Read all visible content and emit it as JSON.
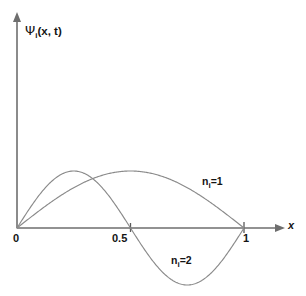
{
  "figure": {
    "background_color": "#ffffff",
    "axis_color": "#6e6e6e",
    "curve_color": "#8a8a8a",
    "text_color": "#141414"
  },
  "axes": {
    "y_label_symbol": "Ψ",
    "y_label_subscript": "i",
    "y_label_rest": "(x, t)",
    "y_label_full": "Ψi (x, t)",
    "x_label": "x",
    "x_ticks": [
      {
        "value": 0,
        "label": "0"
      },
      {
        "value": 0.5,
        "label": "0.5"
      },
      {
        "value": 1,
        "label": "1"
      }
    ]
  },
  "annotations": {
    "n1": {
      "symbol": "n",
      "subscript": "i",
      "equals": "=",
      "value": "1",
      "text": "n i = 1"
    },
    "n2": {
      "symbol": "n",
      "subscript": "i",
      "equals": "=",
      "value": "2",
      "text": "n i = 2"
    }
  },
  "chart_data": {
    "type": "line",
    "title": "",
    "xlabel": "x",
    "ylabel": "Ψi (x, t)",
    "xlim": [
      0,
      1.14
    ],
    "ylim": [
      -1.02,
      1.02
    ],
    "grid": false,
    "legend": "inline-annotations",
    "x": [
      0,
      0.05,
      0.1,
      0.15,
      0.2,
      0.25,
      0.3,
      0.35,
      0.4,
      0.45,
      0.5,
      0.55,
      0.6,
      0.65,
      0.7,
      0.75,
      0.8,
      0.85,
      0.9,
      0.95,
      1
    ],
    "series": [
      {
        "name": "n i = 1",
        "formula": "sin(pi*x)",
        "values": [
          0,
          0.156,
          0.309,
          0.454,
          0.588,
          0.707,
          0.809,
          0.891,
          0.951,
          0.988,
          1,
          0.988,
          0.951,
          0.891,
          0.809,
          0.707,
          0.588,
          0.454,
          0.309,
          0.156,
          0
        ],
        "nodes": [
          0,
          1
        ],
        "peak": {
          "x": 0.5,
          "y": 1
        }
      },
      {
        "name": "n i = 2",
        "formula": "sin(2*pi*x)",
        "values": [
          0,
          0.309,
          0.588,
          0.809,
          0.951,
          1,
          0.951,
          0.809,
          0.588,
          0.309,
          0,
          -0.309,
          -0.588,
          -0.809,
          -0.951,
          -1,
          -0.951,
          -0.809,
          -0.588,
          -0.309,
          0
        ],
        "nodes": [
          0,
          0.5,
          1
        ],
        "peak": {
          "x": 0.25,
          "y": 1
        },
        "trough": {
          "x": 0.75,
          "y": -1
        }
      }
    ]
  }
}
